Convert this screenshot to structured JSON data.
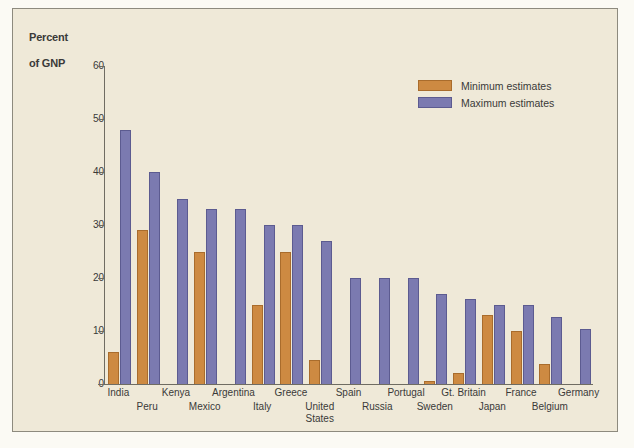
{
  "chart_data": {
    "type": "bar",
    "title": "Percent\nof GNP",
    "xlabel": "",
    "ylabel": "Percent of GNP",
    "ylim": [
      0,
      60
    ],
    "yticks": [
      0,
      10,
      20,
      30,
      40,
      50,
      60
    ],
    "grid": false,
    "legend_position": "top-right",
    "categories": [
      "India",
      "Peru",
      "Kenya",
      "Mexico",
      "Argentina",
      "Italy",
      "Greece",
      "United\nStates",
      "Spain",
      "Russia",
      "Portugal",
      "Sweden",
      "Gt. Britain",
      "Japan",
      "France",
      "Belgium",
      "Germany"
    ],
    "series": [
      {
        "name": "Minimum estimates",
        "color": "#cd8a42",
        "values": [
          6,
          29,
          0,
          25,
          0,
          15,
          25,
          4.5,
          0,
          0,
          0,
          0.5,
          2,
          13,
          10,
          3.7,
          0
        ]
      },
      {
        "name": "Maximum estimates",
        "color": "#7b7ab0",
        "values": [
          48,
          40,
          35,
          33,
          33,
          30,
          30,
          27,
          20,
          20,
          20,
          17,
          16,
          15,
          15,
          12.7,
          10.3
        ]
      }
    ]
  },
  "axis": {
    "title_line1": "Percent",
    "title_line2": "of GNP"
  },
  "legend": {
    "items": [
      {
        "label": "Minimum estimates",
        "swatch": "min-swatch"
      },
      {
        "label": "Maximum estimates",
        "swatch": "max-swatch"
      }
    ]
  },
  "colors": {
    "minimum": "#cd8a42",
    "maximum": "#7b7ab0",
    "background": "#efe9d8",
    "axis": "#6f6c62",
    "text": "#3a3a38"
  }
}
